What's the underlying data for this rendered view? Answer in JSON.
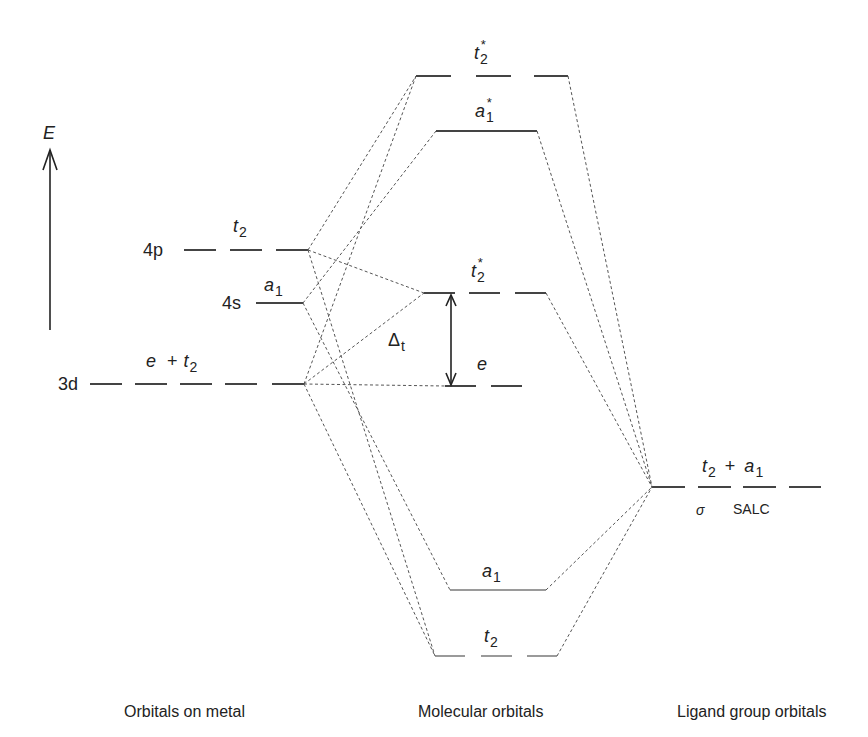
{
  "axis": {
    "energy_label": "E"
  },
  "metal": {
    "p": {
      "orbital": "4p",
      "symmetry": "t",
      "sub": "2"
    },
    "s": {
      "orbital": "4s",
      "symmetry": "a",
      "sub": "1"
    },
    "d": {
      "orbital": "3d",
      "sym1": "e",
      "plus": "+",
      "sym2": "t",
      "sub2": "2"
    }
  },
  "mo": {
    "t2_star_top": {
      "symmetry": "t",
      "sub": "2",
      "star": "*"
    },
    "a1_star": {
      "symmetry": "a",
      "sub": "1",
      "star": "*"
    },
    "t2_star_mid": {
      "symmetry": "t",
      "sub": "2",
      "star": "*"
    },
    "e": {
      "symmetry": "e"
    },
    "delta": {
      "symbol": "Δ",
      "sub": "t"
    },
    "a1": {
      "symmetry": "a",
      "sub": "1"
    },
    "t2": {
      "symmetry": "t",
      "sub": "2"
    }
  },
  "ligand": {
    "sym1": "t",
    "sub1": "2",
    "plus": "+",
    "sym2": "a",
    "sub2": "1",
    "sigma": "σ",
    "salc": "SALC"
  },
  "columns": {
    "metal": "Orbitals on metal",
    "mo": "Molecular orbitals",
    "ligand": "Ligand group orbitals"
  }
}
